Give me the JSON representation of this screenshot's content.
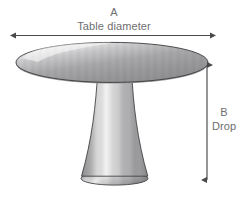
{
  "diagram": {
    "background_color": "#ffffff",
    "dimensions": {
      "width_px": 244,
      "height_px": 200
    },
    "measurements": [
      {
        "key": "A",
        "letter": "A",
        "name": "Table diameter",
        "orientation": "horizontal",
        "arrow": "double-headed",
        "position": "top"
      },
      {
        "key": "B",
        "letter": "B",
        "name": "Drop",
        "orientation": "vertical",
        "arrow": "double-headed",
        "position": "right"
      }
    ],
    "labels": {
      "a_letter": "A",
      "a_text": "Table diameter",
      "b_letter": "B",
      "b_text": "Drop"
    },
    "colors": {
      "label_text": "#6e6e70",
      "arrow": "#4a4a4c",
      "outline": "#3c3c3e",
      "top_light": "#f2f2f2",
      "top_mid": "#9a9a9c",
      "top_dark": "#7c7c7e",
      "base_light": "#f4f4f4",
      "base_mid": "#a6a6a8",
      "base_dark": "#8c8c8e"
    },
    "parts": [
      {
        "name": "tabletop",
        "shape": "ellipse"
      },
      {
        "name": "pedestal-column",
        "shape": "flared-trapezoid"
      },
      {
        "name": "pedestal-base",
        "shape": "ellipse"
      }
    ]
  }
}
